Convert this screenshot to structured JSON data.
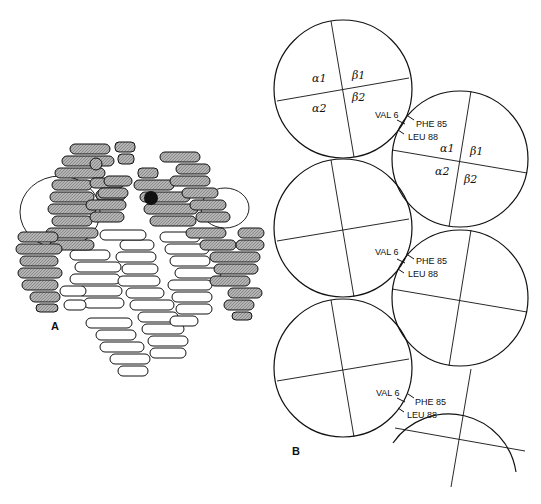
{
  "figure": {
    "panels": [
      {
        "id": "A",
        "label": "A",
        "description": "Hemoglobin S tetramer ribbon model; shaded alpha/beta chains with heme groups"
      },
      {
        "id": "B",
        "label": "B",
        "description": "Schematic packing of hemoglobin S tetramers in polymer fiber"
      }
    ],
    "subunit_labels": {
      "a1": "α1",
      "a2": "α2",
      "b1": "β1",
      "b2": "β2"
    },
    "contact_labels": {
      "val": "VAL 6",
      "phe": "PHE 85",
      "leu": "LEU 88"
    },
    "colors": {
      "line": "#111111",
      "shaded": "#a8a8a8",
      "background": "#ffffff"
    }
  }
}
